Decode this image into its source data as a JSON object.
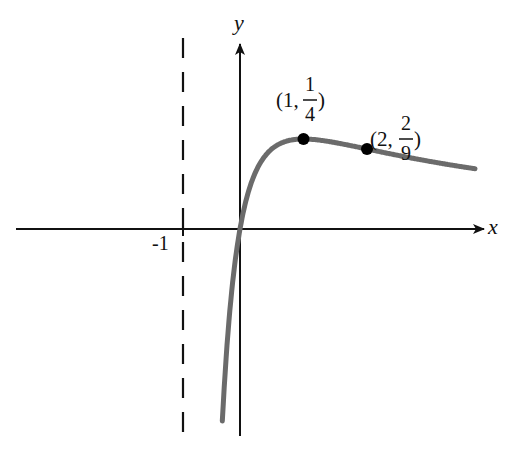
{
  "chart_data": {
    "type": "line",
    "title": "",
    "function": "f(x) = x/(x+1)^2",
    "xlabel": "x",
    "ylabel": "y",
    "tick_labels": [
      "-1"
    ],
    "vertical_asymptote": -1,
    "horizontal_asymptote": 0,
    "marked_points": [
      {
        "x": 1,
        "y": 0.25,
        "label_prefix": "(1, ",
        "num": "1",
        "den": "4",
        "label_suffix": " )"
      },
      {
        "x": 2,
        "y": 0.2222,
        "label_prefix": "(2, ",
        "num": "2",
        "den": "9",
        "label_suffix": " )"
      }
    ],
    "x_range": [
      -3.4,
      3.7
    ],
    "grid": false,
    "colors": {
      "curve": "#6b6b6b",
      "axes": "#111111",
      "points": "#000000"
    }
  }
}
